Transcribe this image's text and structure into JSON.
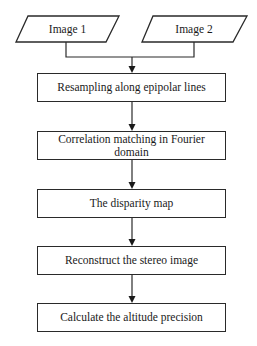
{
  "diagram": {
    "type": "flowchart",
    "inputs": [
      {
        "id": "image1",
        "label": "Image 1",
        "shape": "parallelogram"
      },
      {
        "id": "image2",
        "label": "Image 2",
        "shape": "parallelogram"
      }
    ],
    "steps": [
      {
        "id": "resampling",
        "label": "Resampling along epipolar lines"
      },
      {
        "id": "correlation",
        "label": "Correlation matching in Fourier domain"
      },
      {
        "id": "disparity",
        "label": "The disparity map"
      },
      {
        "id": "reconstruct",
        "label": "Reconstruct the stereo image"
      },
      {
        "id": "calculate",
        "label": "Calculate the altitude precision"
      }
    ],
    "edges": [
      {
        "from": "image1",
        "to": "resampling"
      },
      {
        "from": "image2",
        "to": "resampling"
      },
      {
        "from": "resampling",
        "to": "correlation"
      },
      {
        "from": "correlation",
        "to": "disparity"
      },
      {
        "from": "disparity",
        "to": "reconstruct"
      },
      {
        "from": "reconstruct",
        "to": "calculate"
      }
    ],
    "colors": {
      "stroke": "#2a2a2a",
      "fill": "#ffffff",
      "text": "#1a1a1a"
    }
  }
}
